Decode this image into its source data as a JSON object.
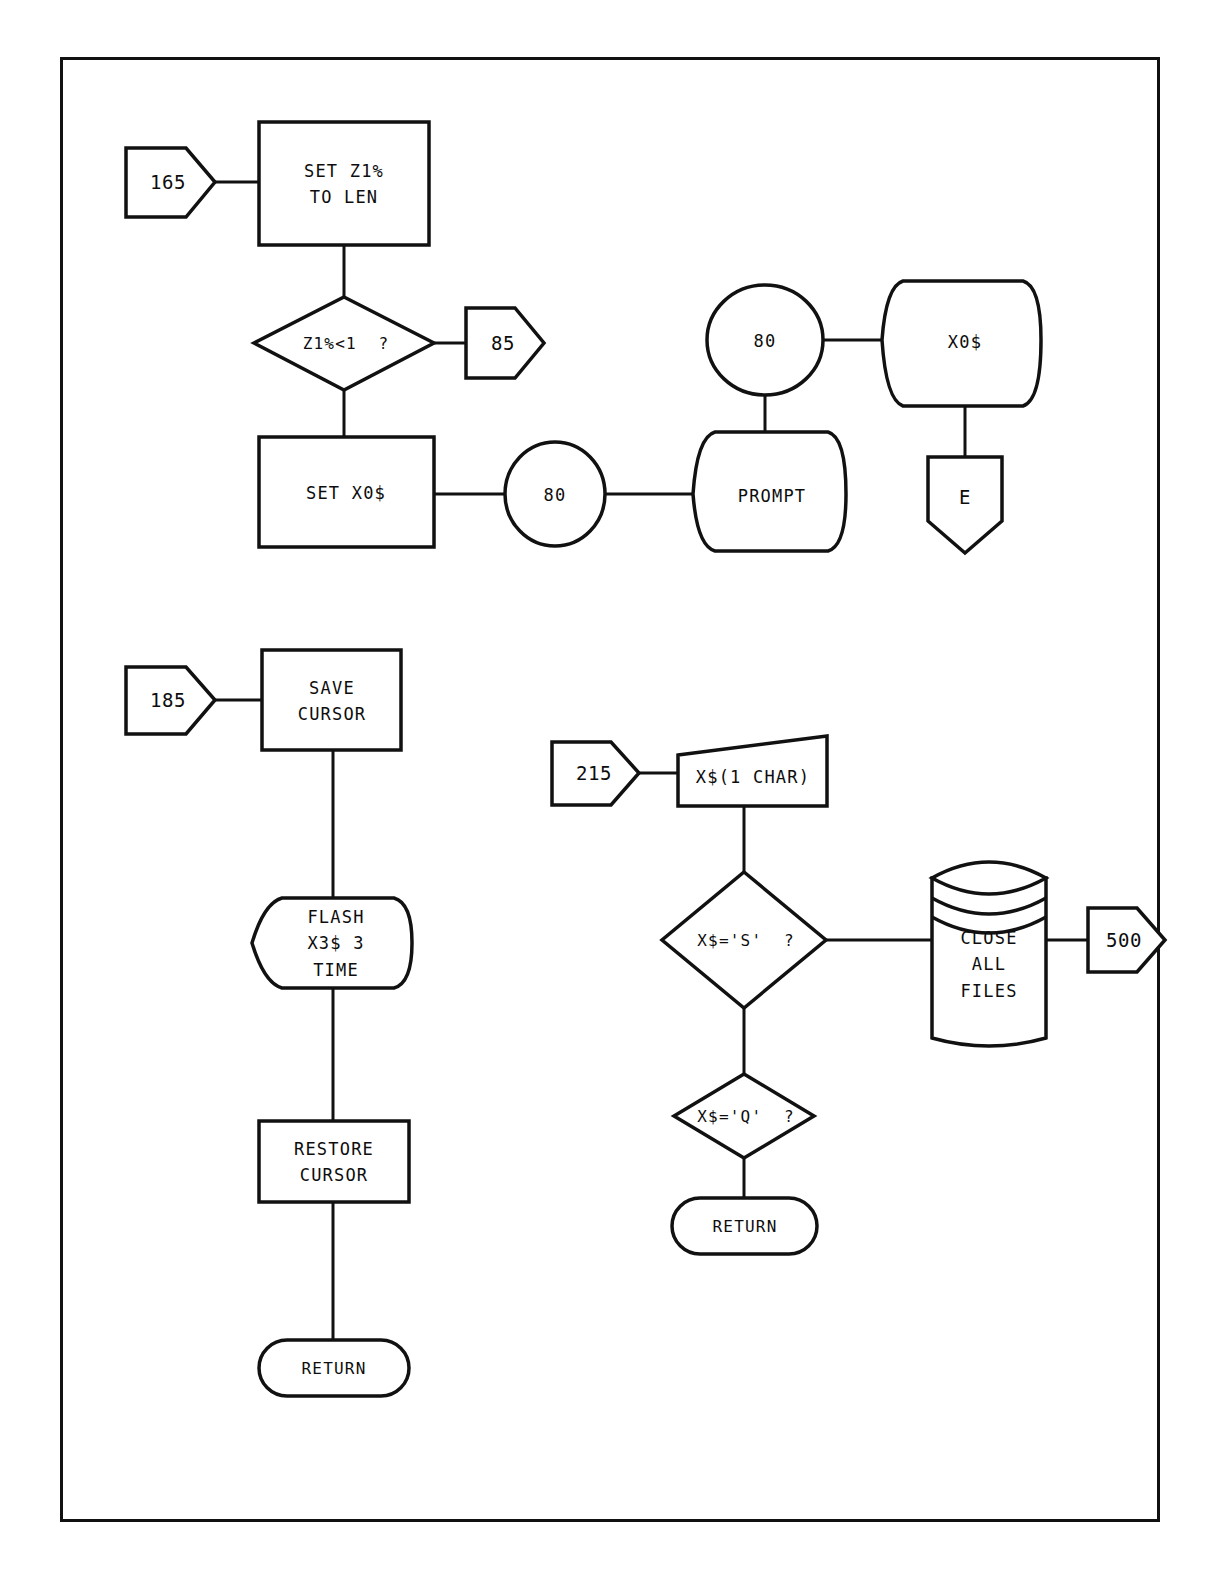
{
  "diagram": {
    "type": "flowchart",
    "stroke_color": "#111111",
    "fill_color": "#ffffff",
    "frame": {
      "visible": true,
      "border_color": "#111111"
    }
  },
  "nodes": {
    "conn_165": {
      "label": "165",
      "shape": "connector-right"
    },
    "proc_set_z1": {
      "label": "SET Z1%\nTO LEN",
      "shape": "process"
    },
    "dec_z1_lt_1": {
      "label": "Z1%<1  ?",
      "shape": "decision"
    },
    "conn_85": {
      "label": "85",
      "shape": "connector-right"
    },
    "proc_set_x0": {
      "label": "SET X0$",
      "shape": "process"
    },
    "circ_80_a": {
      "label": "80",
      "shape": "circle"
    },
    "disp_prompt": {
      "label": "PROMPT",
      "shape": "display"
    },
    "circ_80_b": {
      "label": "80",
      "shape": "circle"
    },
    "disp_x0": {
      "label": "X0$",
      "shape": "display"
    },
    "conn_e": {
      "label": "E",
      "shape": "connector-down"
    },
    "conn_185": {
      "label": "185",
      "shape": "connector-right"
    },
    "proc_save_cur": {
      "label": "SAVE\nCURSOR",
      "shape": "process"
    },
    "disp_flash": {
      "label": "FLASH\nX3$ 3\nTIME",
      "shape": "display"
    },
    "proc_restore": {
      "label": "RESTORE\nCURSOR",
      "shape": "process"
    },
    "term_return_l": {
      "label": "RETURN",
      "shape": "terminator"
    },
    "conn_215": {
      "label": "215",
      "shape": "connector-right"
    },
    "input_xchar": {
      "label": "X$(1 CHAR)",
      "shape": "manual-input"
    },
    "dec_x_is_s": {
      "label": "X$='S'  ?",
      "shape": "decision"
    },
    "dec_x_is_q": {
      "label": "X$='Q'  ?",
      "shape": "decision"
    },
    "db_close_files": {
      "label": "CLOSE\nALL\nFILES",
      "shape": "database"
    },
    "conn_500": {
      "label": "500",
      "shape": "connector-right"
    },
    "term_return_r": {
      "label": "RETURN",
      "shape": "terminator"
    }
  },
  "connections": [
    {
      "from": "conn_165",
      "to": "proc_set_z1"
    },
    {
      "from": "proc_set_z1",
      "to": "dec_z1_lt_1"
    },
    {
      "from": "dec_z1_lt_1",
      "to": "conn_85"
    },
    {
      "from": "dec_z1_lt_1",
      "to": "proc_set_x0"
    },
    {
      "from": "proc_set_x0",
      "to": "circ_80_a"
    },
    {
      "from": "circ_80_a",
      "to": "disp_prompt"
    },
    {
      "from": "disp_prompt",
      "to": "circ_80_b"
    },
    {
      "from": "circ_80_b",
      "to": "disp_x0"
    },
    {
      "from": "disp_x0",
      "to": "conn_e"
    },
    {
      "from": "conn_185",
      "to": "proc_save_cur"
    },
    {
      "from": "proc_save_cur",
      "to": "disp_flash"
    },
    {
      "from": "disp_flash",
      "to": "proc_restore"
    },
    {
      "from": "proc_restore",
      "to": "term_return_l"
    },
    {
      "from": "conn_215",
      "to": "input_xchar"
    },
    {
      "from": "input_xchar",
      "to": "dec_x_is_s"
    },
    {
      "from": "dec_x_is_s",
      "to": "db_close_files"
    },
    {
      "from": "db_close_files",
      "to": "conn_500"
    },
    {
      "from": "dec_x_is_s",
      "to": "dec_x_is_q"
    },
    {
      "from": "dec_x_is_q",
      "to": "term_return_r"
    }
  ]
}
